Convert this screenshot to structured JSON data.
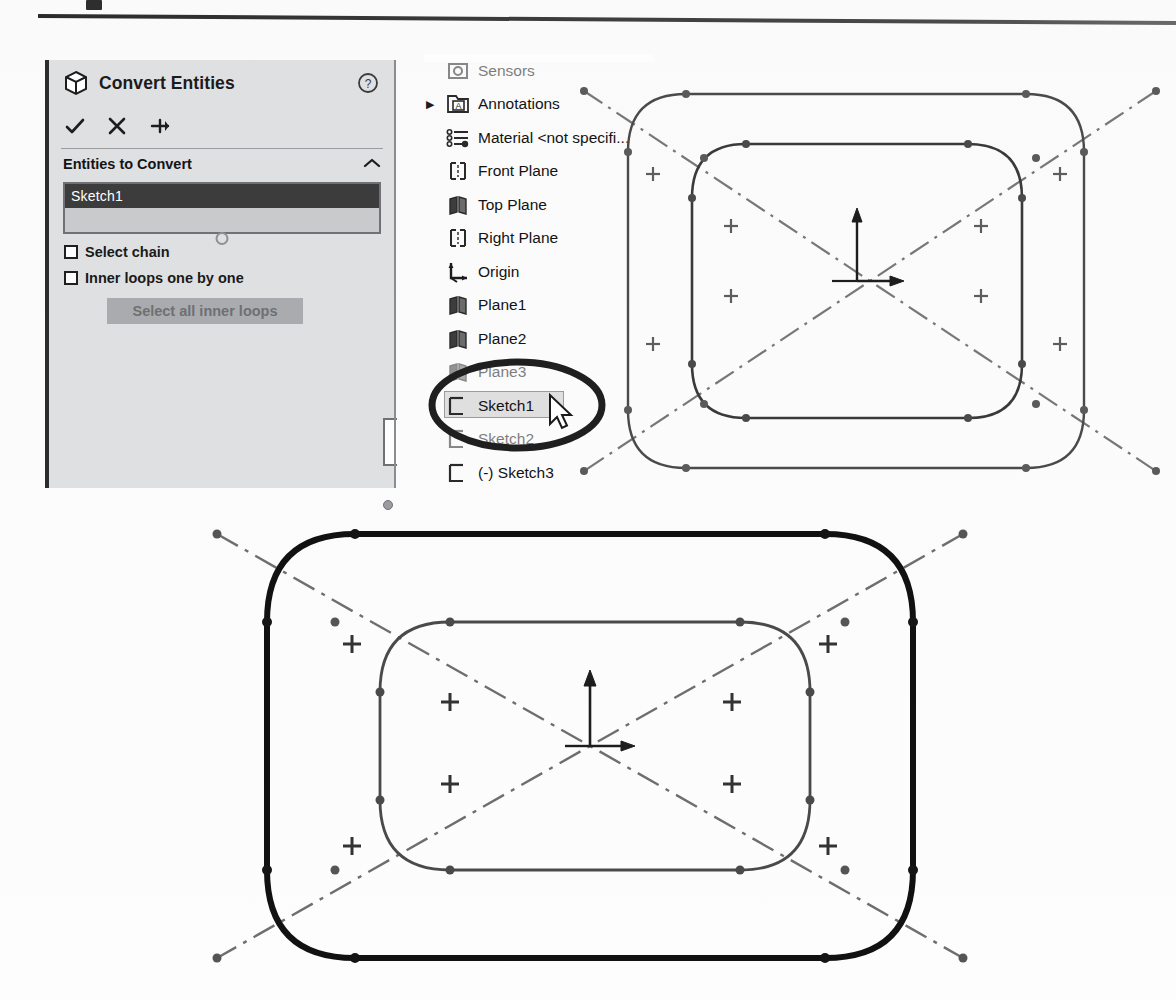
{
  "document": {
    "kind": "solidworks-screenshot",
    "top_rule": true
  },
  "property_manager": {
    "icon": "cube-icon",
    "title": "Convert Entities",
    "help_icon": "question-mark-icon",
    "actions": [
      {
        "name": "ok-check-icon",
        "glyph": "check"
      },
      {
        "name": "cancel-x-icon",
        "glyph": "x"
      },
      {
        "name": "pin-icon",
        "glyph": "pin"
      }
    ],
    "group": {
      "title": "Entities to Convert",
      "collapse_icon": "chevron-up-icon",
      "selection_value": "Sketch1"
    },
    "checkboxes": [
      {
        "label": "Select chain",
        "checked": false
      },
      {
        "label": "Inner loops one by one",
        "checked": false
      }
    ],
    "button": {
      "label": "Select all inner loops",
      "enabled": false
    }
  },
  "feature_tree": {
    "items": [
      {
        "label": "Sensors",
        "icon": "sensors-icon",
        "arrow": false,
        "clipped": true,
        "selected": false
      },
      {
        "label": "Annotations",
        "icon": "annotations-icon",
        "arrow": true,
        "clipped": false,
        "selected": false
      },
      {
        "label": "Material <not specifi...",
        "icon": "material-icon",
        "arrow": false,
        "clipped": false,
        "selected": false
      },
      {
        "label": "Front Plane",
        "icon": "plane-front-icon",
        "arrow": false,
        "clipped": false,
        "selected": false
      },
      {
        "label": "Top Plane",
        "icon": "plane-top-icon",
        "arrow": false,
        "clipped": false,
        "selected": false
      },
      {
        "label": "Right Plane",
        "icon": "plane-right-icon",
        "arrow": false,
        "clipped": false,
        "selected": false
      },
      {
        "label": "Origin",
        "icon": "origin-icon",
        "arrow": false,
        "clipped": false,
        "selected": false
      },
      {
        "label": "Plane1",
        "icon": "plane-top-icon",
        "arrow": false,
        "clipped": false,
        "selected": false
      },
      {
        "label": "Plane2",
        "icon": "plane-top-icon",
        "arrow": false,
        "clipped": false,
        "selected": false
      },
      {
        "label": "Plane3",
        "icon": "plane-top-icon",
        "arrow": false,
        "clipped": true,
        "selected": false
      },
      {
        "label": "Sketch1",
        "icon": "sketch-icon",
        "arrow": false,
        "clipped": false,
        "selected": true
      },
      {
        "label": "Sketch2",
        "icon": "sketch-icon",
        "arrow": false,
        "clipped": true,
        "selected": false
      },
      {
        "label": "(-) Sketch3",
        "icon": "sketch-icon",
        "arrow": false,
        "clipped": false,
        "selected": false
      }
    ]
  },
  "annotations": {
    "highlight_ellipse": "hand-drawn-oval-around-sketch1",
    "cursor": "mouse-pointer-arrow"
  },
  "sketch_view_top": {
    "name": "converted-entities-preview-top",
    "outer_profile": "rounded-rectangle-thin",
    "inner_profile": "rounded-rectangle-thin",
    "construction_lines": "two-diagonal-centerlines",
    "origin_marker": "origin-axes-arrows",
    "midpoint_markers": 8,
    "endpoint_count": 16
  },
  "sketch_view_bottom": {
    "name": "converted-entities-result-bottom",
    "outer_profile": "rounded-rectangle-bold",
    "inner_profile": "rounded-rectangle-thin",
    "construction_lines": "two-diagonal-centerlines",
    "origin_marker": "origin-axes-arrows",
    "midpoint_markers": 8,
    "endpoint_count": 16
  },
  "colors": {
    "panel_bg": "#dfe0e2",
    "panel_accent": "#2c2c2c",
    "selection_bg": "#3c3c3c",
    "selection_fg": "#ffffff",
    "sketch_line": "#3a3a3a",
    "sketch_bold": "#111111",
    "construction_line": "#6e6e6e",
    "annotation_ink": "#1f1f1f"
  }
}
